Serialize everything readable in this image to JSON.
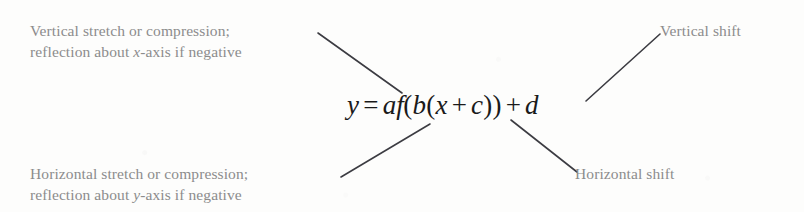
{
  "figure": {
    "background_color": "#fdfdfc",
    "annotation_color": "#8c8c8c",
    "equation_color": "#1a1a1a",
    "line_color": "#3c3c42"
  },
  "equation": {
    "lhs": "y",
    "equals": "=",
    "coefficient_a": "a",
    "function_name": "f",
    "open_paren_outer": "(",
    "coefficient_b": "b",
    "open_paren_inner": "(",
    "variable_x": "x",
    "plus_inner": "+",
    "constant_c": "c",
    "close_paren_inner": ")",
    "close_paren_outer": ")",
    "plus_outer": "+",
    "constant_d": "d",
    "full_text": "y = af(b(x + c)) + d"
  },
  "annotations": {
    "vertical_stretch": {
      "line1": "Vertical stretch or compression;",
      "line2_prefix": "reflection about ",
      "line2_variable": "x",
      "line2_suffix": "-axis if negative"
    },
    "horizontal_stretch": {
      "line1": "Horizontal stretch or compression;",
      "line2_prefix": "reflection about ",
      "line2_variable": "y",
      "line2_suffix": "-axis if negative"
    },
    "vertical_shift": {
      "label": "Vertical shift"
    },
    "horizontal_shift": {
      "label": "Horizontal shift"
    }
  },
  "leader_lines": [
    {
      "name": "line-vertical-stretch-to-a",
      "x1": 318,
      "y1": 33,
      "x2": 402,
      "y2": 93
    },
    {
      "name": "line-horizontal-stretch-to-b",
      "x1": 341,
      "y1": 177,
      "x2": 430,
      "y2": 124
    },
    {
      "name": "line-vertical-shift-to-d",
      "x1": 660,
      "y1": 34,
      "x2": 586,
      "y2": 101
    },
    {
      "name": "line-horizontal-shift-to-c",
      "x1": 511,
      "y1": 120,
      "x2": 577,
      "y2": 172
    }
  ]
}
